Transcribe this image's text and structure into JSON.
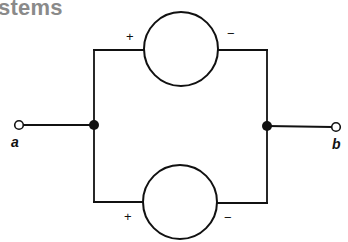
{
  "heading": {
    "text": "stems"
  },
  "diagram": {
    "type": "parallel-circuit",
    "colors": {
      "line": "#111111",
      "heading": "#8a8a8a",
      "background": "#ffffff"
    },
    "terminals": [
      {
        "id": "a",
        "label": "a"
      },
      {
        "id": "b",
        "label": "b"
      }
    ],
    "sources": [
      {
        "position": "top",
        "polarity": {
          "left": "+",
          "right": "−"
        }
      },
      {
        "position": "bottom",
        "polarity": {
          "left": "+",
          "right": "−"
        }
      }
    ],
    "junctions": [
      {
        "position": "left"
      },
      {
        "position": "right"
      }
    ]
  }
}
